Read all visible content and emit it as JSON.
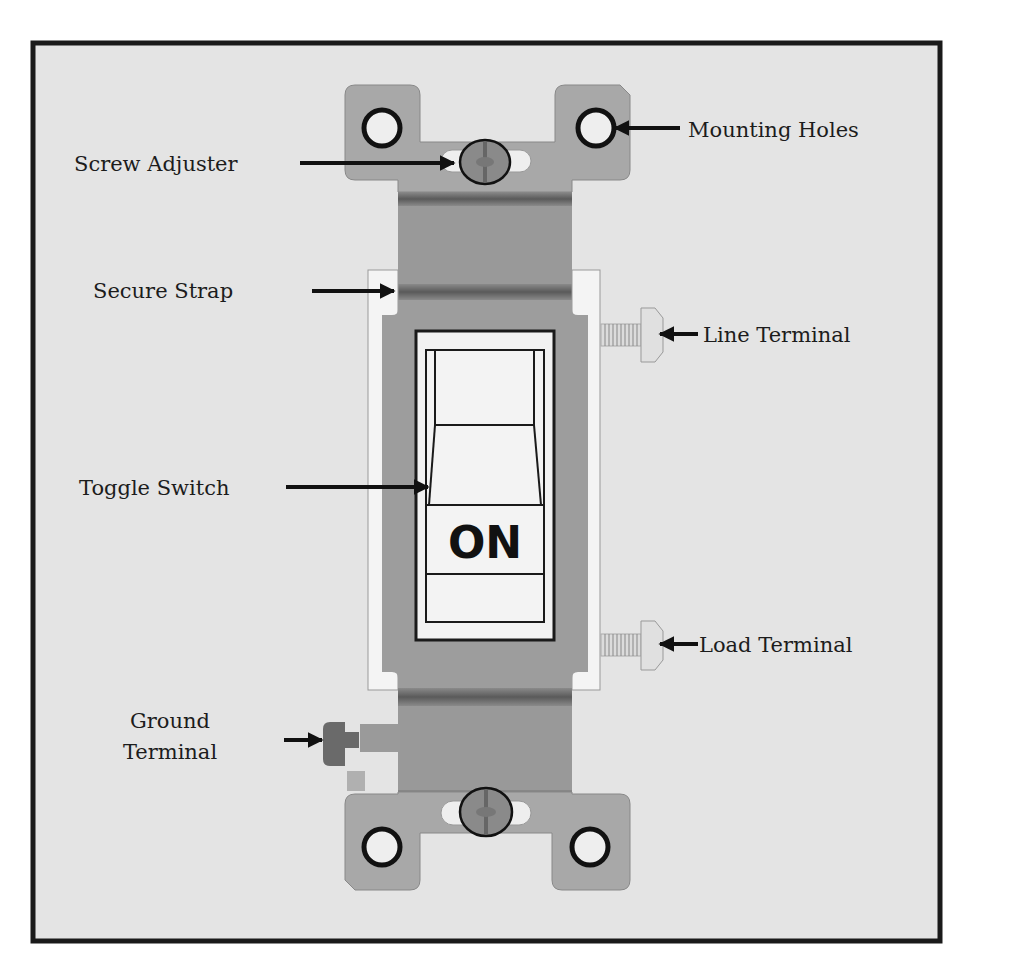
{
  "diagram": {
    "colors": {
      "background": "#e4e4e4",
      "frame": "#1a1a1a",
      "metal_strap": "#a6a6a6",
      "metal_dark": "#6f6f6f",
      "body": "#9a9a9a",
      "white_part": "#f2f2f2",
      "outline": "#222222"
    },
    "toggle_state_text": "ON",
    "labels": {
      "mounting_holes": "Mounting Holes",
      "screw_adjuster": "Screw Adjuster",
      "secure_strap": "Secure Strap",
      "line_terminal": "Line Terminal",
      "toggle_switch": "Toggle Switch",
      "load_terminal": "Load Terminal",
      "ground_terminal_line1": "Ground",
      "ground_terminal_line2": "Terminal"
    }
  }
}
